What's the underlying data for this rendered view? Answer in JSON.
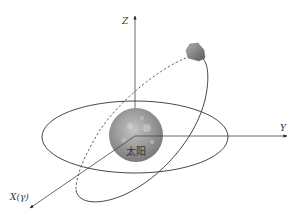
{
  "diagram": {
    "axes": {
      "z_label": "Z",
      "y_label": "Y",
      "x_label": "X(γ)"
    },
    "sun": {
      "label": "太阳"
    },
    "orbits": [
      {
        "name": "ecliptic-plane-orbit",
        "style": "solid"
      },
      {
        "name": "inclined-orbit",
        "style": "solid-with-dashed-back-segment"
      }
    ],
    "body": {
      "name": "asteroid"
    },
    "colors": {
      "line": "#333333",
      "sun_base": "#9a9a9a",
      "asteroid": "#888888"
    }
  }
}
